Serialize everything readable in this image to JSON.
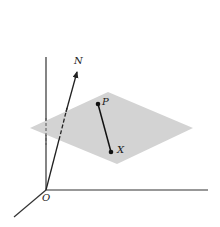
{
  "diagram": {
    "labels": {
      "origin": "O",
      "normal": "N",
      "point_p": "P",
      "point_x": "X"
    },
    "colors": {
      "plane": "#d3d3d3",
      "lines": "#222222",
      "background": "#ffffff"
    }
  }
}
